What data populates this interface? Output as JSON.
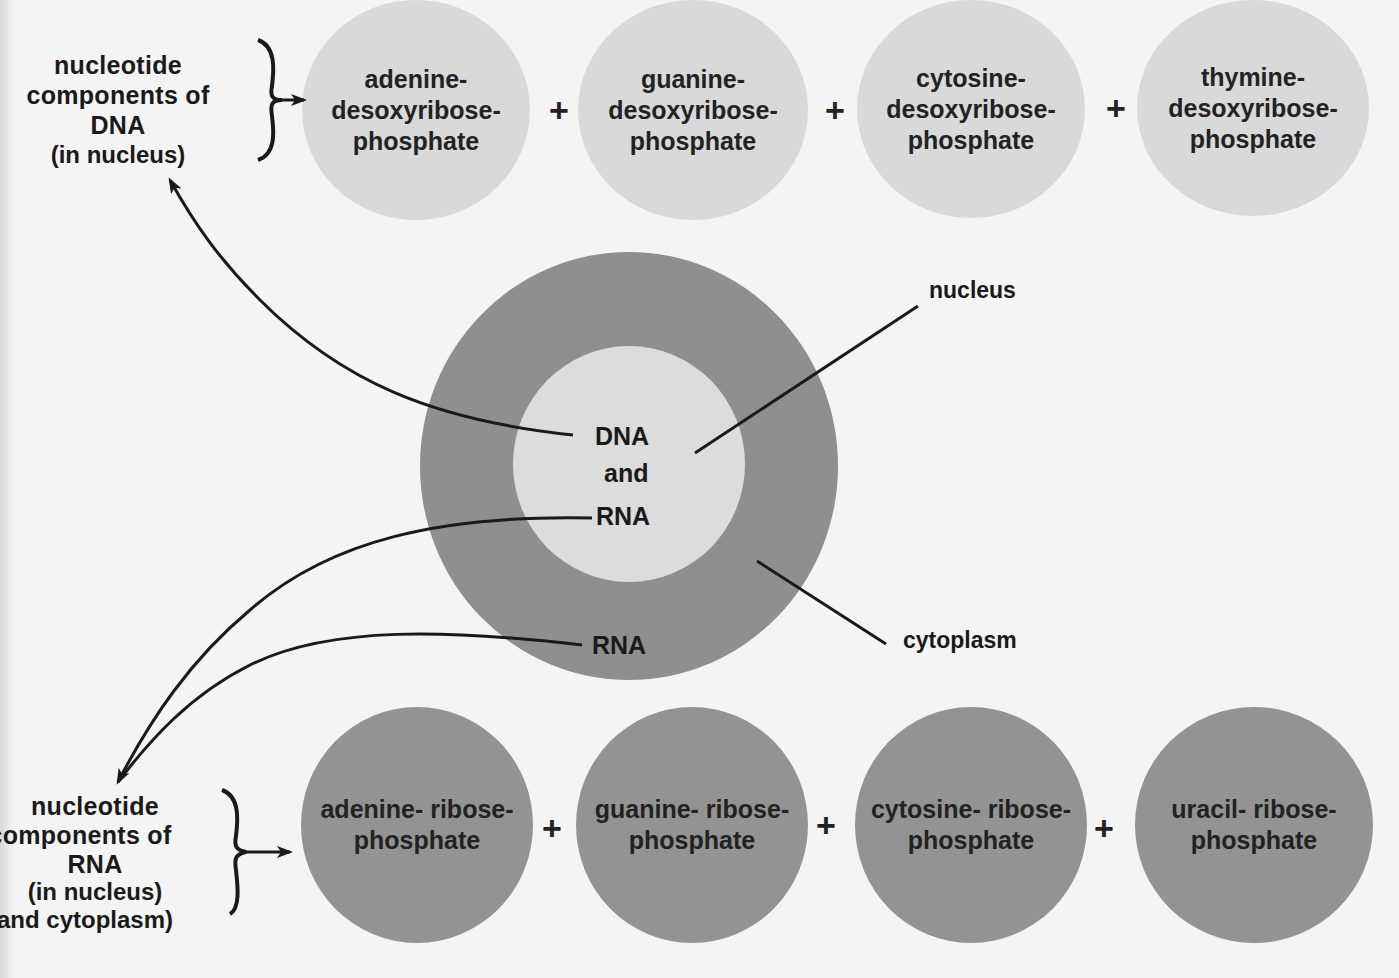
{
  "diagram": {
    "colors": {
      "background": "#f4f4f4",
      "dna_nucleotide_fill": "#d9d9d9",
      "rna_nucleotide_fill": "#939393",
      "cytoplasm_fill": "#8f8f8f",
      "nucleus_fill": "#dcdcdc",
      "ink": "#1a1a1a"
    },
    "dna_group": {
      "label_lines": [
        "nucleotide",
        "components of",
        "DNA"
      ],
      "location": "(in nucleus)",
      "nucleotides": [
        {
          "text": "adenine-\ndesoxyribose-\nphosphate"
        },
        {
          "text": "guanine-\ndesoxyribose-\nphosphate"
        },
        {
          "text": "cytosine-\ndesoxyribose-\nphosphate"
        },
        {
          "text": "thymine-\ndesoxyribose-\nphosphate"
        }
      ],
      "operator": "+"
    },
    "rna_group": {
      "label_lines": [
        "nucleotide",
        "components of",
        "RNA"
      ],
      "location_lines": [
        "(in nucleus)",
        "and cytoplasm)"
      ],
      "nucleotides": [
        {
          "text": "adenine- ribose-\nphosphate"
        },
        {
          "text": "guanine- ribose-\nphosphate"
        },
        {
          "text": "cytosine- ribose-\nphosphate"
        },
        {
          "text": "uracil- ribose-\nphosphate"
        }
      ],
      "operator": "+"
    },
    "cell": {
      "nucleus_text": [
        "DNA",
        "and",
        "RNA"
      ],
      "cytoplasm_text": "RNA",
      "callouts": {
        "nucleus": "nucleus",
        "cytoplasm": "cytoplasm"
      }
    }
  }
}
